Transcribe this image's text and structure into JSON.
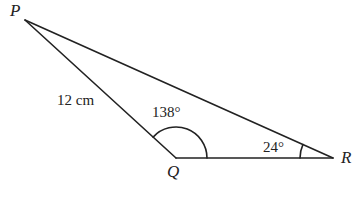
{
  "diagram": {
    "type": "triangle",
    "vertices": [
      {
        "id": "P",
        "label": "P"
      },
      {
        "id": "Q",
        "label": "Q"
      },
      {
        "id": "R",
        "label": "R"
      }
    ],
    "sides": [
      {
        "between": [
          "P",
          "Q"
        ],
        "label": "12 cm"
      }
    ],
    "angles": [
      {
        "at": "Q",
        "label": "138°"
      },
      {
        "at": "R",
        "label": "24°"
      }
    ],
    "stroke_color": "#222222"
  }
}
